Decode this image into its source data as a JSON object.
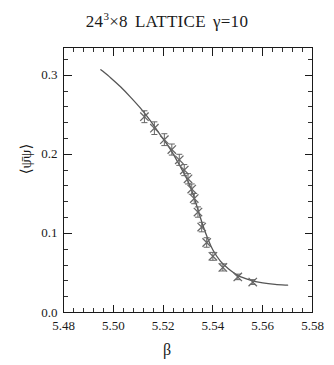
{
  "figure": {
    "title_parts": {
      "lattice_size": "24",
      "exponent": "3",
      "times_temporal": "×8",
      "lattice_word": "LATTICE",
      "gamma": "γ=10"
    },
    "title_full": "24³×8  LATTICE  γ=10",
    "background_color": "#ffffff",
    "foreground_color": "#1a1a1a",
    "curve_color": "#555555",
    "marker_color": "#666666"
  },
  "chart_data": {
    "type": "scatter",
    "xlabel": "β",
    "ylabel": "⟨ψ̄ψ⟩",
    "xlim": [
      5.48,
      5.58
    ],
    "ylim": [
      0.0,
      0.335
    ],
    "grid": false,
    "legend": null,
    "xticks": [
      5.48,
      5.5,
      5.52,
      5.54,
      5.56,
      5.58
    ],
    "xtick_labels": [
      "5.48",
      "5.50",
      "5.52",
      "5.54",
      "5.56",
      "5.58"
    ],
    "x_minor_per_major": 5,
    "yticks": [
      0.0,
      0.1,
      0.2,
      0.3
    ],
    "ytick_labels": [
      "0.0",
      "0.1",
      "0.2",
      "0.3"
    ],
    "y_minor_per_major": 5,
    "marker_style": "x-cross",
    "errorbar_direction": "vertical",
    "series": [
      {
        "name": "⟨ψ̄ψ⟩ data",
        "x": [
          5.5125,
          5.5165,
          5.5205,
          5.5235,
          5.5265,
          5.5285,
          5.53,
          5.5315,
          5.5325,
          5.534,
          5.5355,
          5.5375,
          5.54,
          5.544,
          5.55,
          5.556
        ],
        "y": [
          0.2475,
          0.233,
          0.2185,
          0.206,
          0.193,
          0.18,
          0.169,
          0.156,
          0.144,
          0.127,
          0.108,
          0.0885,
          0.071,
          0.057,
          0.045,
          0.0385
        ],
        "yerr": [
          0.0075,
          0.008,
          0.0075,
          0.007,
          0.007,
          0.007,
          0.0065,
          0.0065,
          0.0065,
          0.0065,
          0.006,
          0.006,
          0.005,
          0.0045,
          0.0035,
          0.003
        ]
      }
    ],
    "fit_curve": {
      "name": "fit",
      "x": [
        5.495,
        5.499,
        5.503,
        5.507,
        5.511,
        5.515,
        5.519,
        5.523,
        5.527,
        5.53,
        5.532,
        5.534,
        5.536,
        5.538,
        5.54,
        5.543,
        5.546,
        5.55,
        5.555,
        5.56,
        5.565,
        5.57
      ],
      "y": [
        0.307,
        0.2965,
        0.285,
        0.272,
        0.258,
        0.242,
        0.224,
        0.206,
        0.184,
        0.166,
        0.15,
        0.13,
        0.11,
        0.093,
        0.079,
        0.065,
        0.056,
        0.047,
        0.041,
        0.0375,
        0.0355,
        0.0345
      ]
    }
  }
}
